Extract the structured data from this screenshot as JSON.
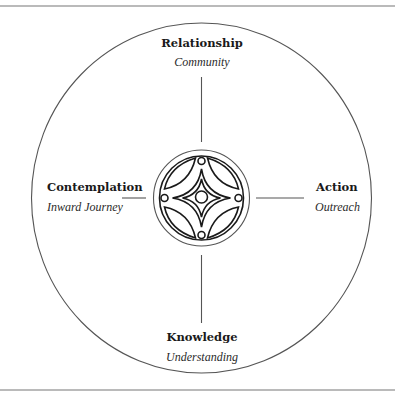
{
  "diagram": {
    "type": "quadrant-wheel",
    "center": {
      "icon": "celtic-knot-emblem-icon"
    },
    "nodes": [
      {
        "position": "top",
        "title": "Relationship",
        "subtitle": "Community"
      },
      {
        "position": "left",
        "title": "Contemplation",
        "subtitle": "Inward Journey"
      },
      {
        "position": "right",
        "title": "Action",
        "subtitle": "Outreach"
      },
      {
        "position": "bottom",
        "title": "Knowledge",
        "subtitle": "Understanding"
      }
    ],
    "colors": {
      "ink": "#1a1a1a",
      "line": "#555555",
      "background": "#ffffff"
    }
  }
}
